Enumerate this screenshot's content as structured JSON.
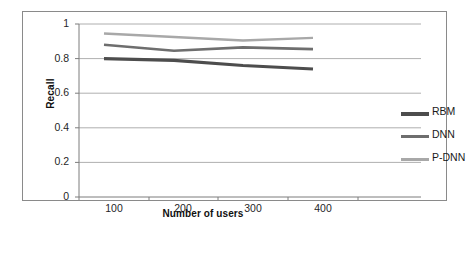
{
  "figure": {
    "border_color": "#8a8a8a",
    "background": "#ffffff"
  },
  "chart_data": {
    "type": "line",
    "title": "",
    "xlabel": "Number of users",
    "ylabel": "Recall",
    "categories": [
      "100",
      "200",
      "300",
      "400"
    ],
    "x": [
      100,
      200,
      300,
      400
    ],
    "ylim": [
      0,
      1
    ],
    "yticks": [
      "0",
      "0.2",
      "0.4",
      "0.6",
      "0.8",
      "1"
    ],
    "ytick_values": [
      0,
      0.2,
      0.4,
      0.6,
      0.8,
      1
    ],
    "grid": true,
    "grid_axis": "y",
    "legend_position": "right",
    "series": [
      {
        "name": "RBM",
        "values": [
          0.8,
          0.79,
          0.76,
          0.74
        ],
        "color": "#4d4d4d",
        "width": 3.2
      },
      {
        "name": "DNN",
        "values": [
          0.88,
          0.845,
          0.865,
          0.855
        ],
        "color": "#6e6e6e",
        "width": 2.6
      },
      {
        "name": "P-DNN",
        "values": [
          0.945,
          0.925,
          0.905,
          0.92
        ],
        "color": "#a8a8a8",
        "width": 2.4
      }
    ]
  },
  "axis": {
    "y_label": "Recall",
    "x_label": "Number of users",
    "y_ticks": [
      "1",
      "0.8",
      "0.6",
      "0.4",
      "0.2",
      "0"
    ],
    "x_ticks": [
      "100",
      "200",
      "300",
      "400"
    ]
  },
  "legend": {
    "items": [
      {
        "label": "RBM",
        "color": "#4d4d4d"
      },
      {
        "label": "DNN",
        "color": "#6e6e6e"
      },
      {
        "label": "P-DNN",
        "color": "#a8a8a8"
      }
    ]
  }
}
